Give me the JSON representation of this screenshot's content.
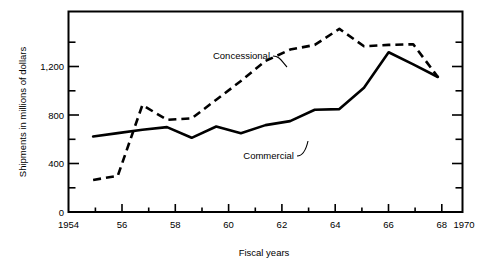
{
  "chart_data": {
    "type": "line",
    "title": "",
    "xlabel": "Fiscal years",
    "ylabel": "Shipments in millions of dollars",
    "xlim": [
      1954,
      1970
    ],
    "ylim": [
      0,
      1500
    ],
    "grid": false,
    "legend_position": "inline-annotation",
    "x_major_ticks": [
      1954,
      1956,
      1958,
      1960,
      1962,
      1964,
      1966,
      1968,
      1970
    ],
    "x_major_tick_labels": [
      "1954",
      "56",
      "58",
      "60",
      "62",
      "64",
      "66",
      "68",
      "1970"
    ],
    "x_minor_ticks": [
      1955,
      1957,
      1959,
      1961,
      1963,
      1965,
      1967,
      1969
    ],
    "y_major_ticks": [
      0,
      400,
      800,
      1200
    ],
    "y_major_tick_labels": [
      "0",
      "400",
      "800",
      "1,200"
    ],
    "y_minor_ticks": [
      200,
      600,
      1000,
      1400
    ],
    "x": [
      1955,
      1956,
      1957,
      1958,
      1959,
      1960,
      1961,
      1962,
      1963,
      1964,
      1965,
      1966,
      1967,
      1968,
      1969
    ],
    "series": [
      {
        "name": "Concessional",
        "style": "dashed",
        "values": [
          240,
          270,
          800,
          690,
          700,
          840,
          980,
          1130,
          1215,
          1250,
          1370,
          1240,
          1250,
          1255,
          1010
        ]
      },
      {
        "name": "Commercial",
        "style": "solid",
        "values": [
          565,
          590,
          615,
          635,
          555,
          640,
          590,
          650,
          680,
          765,
          770,
          930,
          1195,
          1105,
          1010
        ]
      }
    ],
    "annotations": [
      {
        "text": "Concessional",
        "x": 1962,
        "y": 1275
      },
      {
        "text": "Commercial",
        "x": 1962,
        "y": 480
      }
    ]
  },
  "axes": {
    "y_axis_label": "Shipments in millions of dollars",
    "x_axis_label": "Fiscal years",
    "y_tick_labels": [
      "1,200",
      "800",
      "400",
      "0"
    ],
    "x_tick_labels": [
      "1954",
      "56",
      "58",
      "60",
      "62",
      "64",
      "66",
      "68",
      "1970"
    ]
  },
  "series_labels": {
    "concessional": "Concessional",
    "commercial": "Commercial"
  },
  "colors": {
    "line": "#000000",
    "background": "#ffffff",
    "text": "#000000"
  }
}
